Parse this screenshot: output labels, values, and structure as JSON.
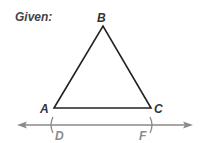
{
  "heading": "Given:",
  "diagram": {
    "type": "geometry",
    "triangle": {
      "vertices": [
        {
          "label": "A",
          "x": 54,
          "y": 108
        },
        {
          "label": "B",
          "x": 103,
          "y": 26
        },
        {
          "label": "C",
          "x": 151,
          "y": 108
        }
      ],
      "stroke": "#222222"
    },
    "line": {
      "y": 125,
      "x1": 18,
      "x2": 192,
      "arrows": "both",
      "stroke": "#888888",
      "points": [
        {
          "label": "D",
          "x": 52
        },
        {
          "label": "F",
          "x": 151
        }
      ]
    },
    "labels": {
      "A": "A",
      "B": "B",
      "C": "C",
      "D": "D",
      "F": "F"
    }
  }
}
